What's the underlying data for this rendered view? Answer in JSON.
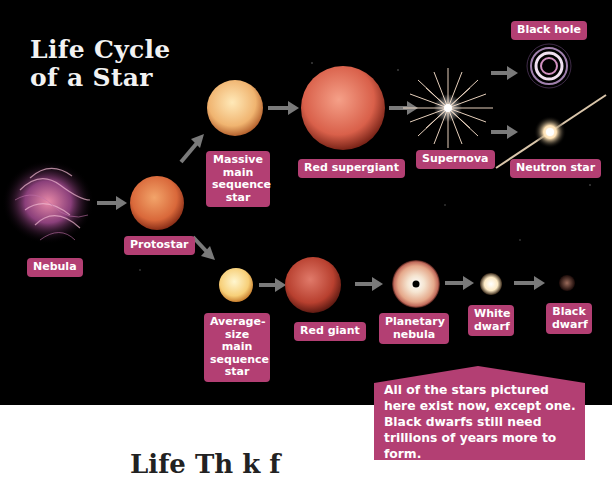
{
  "title": {
    "line1": "Life Cycle",
    "line2": "of a Star"
  },
  "colors": {
    "label_bg": "#b33f73",
    "arrow": "#7a7a7a",
    "background": "#000000",
    "callout_bg": "#b33f73"
  },
  "stages": {
    "nebula": {
      "label": "Nebula"
    },
    "protostar": {
      "label": "Protostar"
    },
    "massive_main_sequence": {
      "label": "Massive\nmain\nsequence\nstar"
    },
    "red_supergiant": {
      "label": "Red supergiant"
    },
    "supernova": {
      "label": "Supernova"
    },
    "black_hole": {
      "label": "Black hole"
    },
    "neutron_star": {
      "label": "Neutron star"
    },
    "average_main_sequence": {
      "label": "Average-\nsize main\nsequence\nstar"
    },
    "red_giant": {
      "label": "Red giant"
    },
    "planetary_nebula": {
      "label": "Planetary\nnebula"
    },
    "white_dwarf": {
      "label": "White\ndwarf"
    },
    "black_dwarf": {
      "label": "Black\ndwarf"
    }
  },
  "callout": {
    "text": "All of the stars pictured here exist now, except one. Black dwarfs still need trillions of years more to form."
  },
  "bottom_heading": {
    "text": "Life Th    k  f"
  }
}
